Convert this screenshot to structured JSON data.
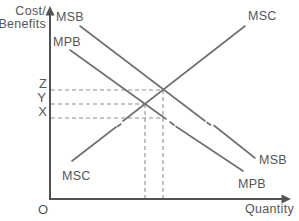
{
  "diagram_type": "economics-externality-diagram",
  "axes": {
    "y_label_line1": "Cost/",
    "y_label_line2": "Benefits",
    "x_label": "Quantity",
    "origin_label": "O"
  },
  "curves": {
    "msb": {
      "label": "MSB"
    },
    "mpb": {
      "label": "MPB"
    },
    "msc": {
      "label": "MSC"
    }
  },
  "y_axis_markers": {
    "z": "Z",
    "y": "Y",
    "x": "X"
  },
  "colors": {
    "curve_line": "#6e6f71",
    "axis_line": "#515254",
    "dashed_line": "#8b8d90",
    "text": "#55565a",
    "background": "#ffffff"
  }
}
